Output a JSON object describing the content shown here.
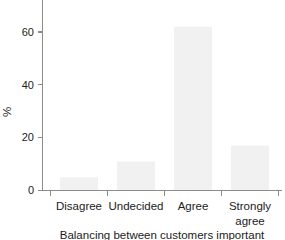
{
  "chart_data": {
    "type": "bar",
    "title": "",
    "subtitle": "",
    "caption": "Balancing between customers important",
    "categories": [
      "Disagree",
      "Undecided",
      "Agree",
      "Strongly agree"
    ],
    "values": [
      5,
      11,
      62,
      17
    ],
    "series": [
      {
        "name": "%",
        "values": [
          5,
          11,
          62,
          17
        ]
      }
    ],
    "xlabel": "",
    "ylabel": "%",
    "ylim": [
      0,
      72
    ],
    "xlim": [
      0,
      4
    ],
    "yticks": [
      0,
      20,
      40,
      60
    ],
    "ytick_labels": [
      "0",
      "20",
      "40",
      "60"
    ],
    "grid": false,
    "legend": false,
    "legend_position": "none",
    "bar_color": "#f1f1f1",
    "axis_color": "#8c8c8c",
    "text_color": "#1c1c1c",
    "background_color": "#ffffff",
    "annotations": []
  },
  "axes": {
    "y_axis_label": "%",
    "y_tick_0": "0",
    "y_tick_1": "20",
    "y_tick_2": "40",
    "y_tick_3": "60"
  },
  "categories_labels": {
    "cat_0": "Disagree",
    "cat_1": "Undecided",
    "cat_2": "Agree",
    "cat_3_line1": "Strongly",
    "cat_3_line2": "agree"
  },
  "caption": {
    "text": "Balancing between customers important"
  }
}
